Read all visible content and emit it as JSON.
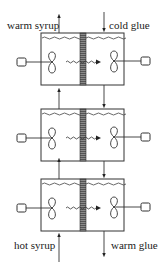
{
  "diagram": {
    "type": "countercurrent-stage-heat-exchanger",
    "stages": 3,
    "labels": {
      "top_left": "warm syrup",
      "top_right": "cold glue",
      "bottom_left": "hot syrup",
      "bottom_right": "warm glue"
    },
    "flows": [
      {
        "stream": "syrup",
        "direction": "up",
        "side": "left",
        "enters": "hot syrup",
        "exits": "warm syrup"
      },
      {
        "stream": "glue",
        "direction": "down",
        "side": "right",
        "enters": "cold glue",
        "exits": "warm glue"
      }
    ],
    "components_per_stage": [
      "left-compartment",
      "right-compartment",
      "hatched-partition",
      "left-impeller",
      "right-impeller",
      "left-motor",
      "right-motor",
      "heat-transfer-arrow",
      "liquid-surface"
    ],
    "colors": {
      "line": "#333333",
      "partition": "#777777",
      "background": "#ffffff"
    }
  }
}
